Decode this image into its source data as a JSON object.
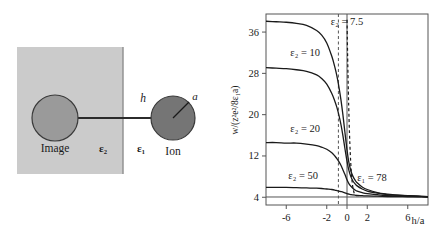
{
  "figure": {
    "panels": [
      "diagram",
      "chart"
    ]
  },
  "diagram": {
    "slab_label": "ε₂",
    "medium_label": "ε₁",
    "image_label": "Image",
    "ion_label": "Ion",
    "distance_label": "h",
    "radius_label": "a",
    "colors": {
      "slab_fill": "#cbcbcb",
      "image_circle_fill": "#9a9a9a",
      "ion_circle_fill": "#757575",
      "outline": "#3a3a3a",
      "connector": "#2b2b2b"
    }
  },
  "chart_data": {
    "type": "line",
    "title": "",
    "xlabel": "h/a",
    "ylabel": "w/(z²e²/8ε₁a)",
    "xlim": [
      -8,
      8
    ],
    "ylim": [
      2.5,
      39.5
    ],
    "xticks": [
      -6,
      -2,
      0,
      2,
      6
    ],
    "xticklabels": [
      "-6",
      "-2",
      "0",
      "2",
      "6"
    ],
    "yticks": [
      4,
      12,
      20,
      28,
      36
    ],
    "yticklabels": [
      "4",
      "12",
      "20",
      "28",
      "36"
    ],
    "grid": false,
    "legend_position": "inline-annotations",
    "x": [
      -8,
      -7,
      -6,
      -5,
      -4,
      -3,
      -2.5,
      -2,
      -1.5,
      -1.2,
      -1,
      -0.8,
      -0.6,
      -0.4,
      -0.2,
      0,
      0.2,
      0.4,
      0.6,
      0.8,
      1,
      1.5,
      2,
      3,
      4,
      5,
      6,
      7,
      8
    ],
    "series": [
      {
        "name": "ε₂ = 7.5",
        "label": "ε₂ = 7.5",
        "epsilon2": 7.5,
        "color": "#1a1a1a",
        "dash": "none",
        "values": [
          38.1,
          38.0,
          37.9,
          37.7,
          37.3,
          36.3,
          35.4,
          33.9,
          31.3,
          29.2,
          27.5,
          25.4,
          22.9,
          19.9,
          16.5,
          13.2,
          10.6,
          9.0,
          8.0,
          7.3,
          6.8,
          6.0,
          5.5,
          4.9,
          4.6,
          4.4,
          4.3,
          4.2,
          4.1
        ]
      },
      {
        "name": "ε₂ = 10",
        "label": "ε₂ = 10",
        "epsilon2": 10,
        "color": "#1a1a1a",
        "dash": "none",
        "values": [
          29.1,
          29.0,
          28.9,
          28.7,
          28.4,
          27.7,
          27.0,
          25.9,
          24.1,
          22.6,
          21.4,
          19.9,
          18.1,
          15.9,
          13.4,
          11.0,
          9.1,
          7.9,
          7.1,
          6.6,
          6.2,
          5.6,
          5.2,
          4.8,
          4.5,
          4.4,
          4.3,
          4.2,
          4.1
        ]
      },
      {
        "name": "ε₂ = 20",
        "label": "ε₂ = 20",
        "epsilon2": 20,
        "color": "#1a1a1a",
        "dash": "none",
        "values": [
          14.6,
          14.6,
          14.5,
          14.5,
          14.3,
          14.0,
          13.7,
          13.3,
          12.6,
          12.0,
          11.5,
          10.9,
          10.2,
          9.3,
          8.4,
          7.4,
          6.6,
          6.1,
          5.7,
          5.4,
          5.2,
          4.9,
          4.7,
          4.5,
          4.3,
          4.25,
          4.2,
          4.15,
          4.1
        ]
      },
      {
        "name": "ε₂ = 50",
        "label": "ε₂ = 50",
        "epsilon2": 50,
        "color": "#1a1a1a",
        "dash": "none",
        "values": [
          5.9,
          5.9,
          5.9,
          5.85,
          5.8,
          5.75,
          5.7,
          5.6,
          5.5,
          5.4,
          5.3,
          5.2,
          5.1,
          5.0,
          4.85,
          4.7,
          4.6,
          4.5,
          4.45,
          4.4,
          4.35,
          4.3,
          4.25,
          4.2,
          4.15,
          4.12,
          4.1,
          4.08,
          4.05
        ]
      }
    ],
    "annotations": [
      {
        "text": "ε₂ = 7.5",
        "x": -1.6,
        "y": 37.3,
        "name": "curve-label-75"
      },
      {
        "text": "ε₂ = 10",
        "x": -5.6,
        "y": 31.4,
        "name": "curve-label-10"
      },
      {
        "text": "ε₂ = 20",
        "x": -5.6,
        "y": 16.6,
        "name": "curve-label-20"
      },
      {
        "text": "ε₂ = 50",
        "x": -5.8,
        "y": 7.6,
        "name": "curve-label-50"
      },
      {
        "text": "ε₁ = 78",
        "x": 1.0,
        "y": 7.2,
        "name": "medium-label-78"
      }
    ],
    "reference_lines": [
      {
        "name": "zero-axis-line",
        "type": "vertical",
        "x": 0,
        "style": "solid"
      },
      {
        "name": "minus-one-dashed-line",
        "type": "vertical",
        "x": -0.85,
        "style": "dashed"
      },
      {
        "name": "epsilon1-dashed-curve",
        "type": "curve",
        "style": "dashed"
      },
      {
        "name": "asymptote-line-4",
        "type": "horizontal",
        "y": 4.05,
        "style": "solid"
      }
    ]
  }
}
